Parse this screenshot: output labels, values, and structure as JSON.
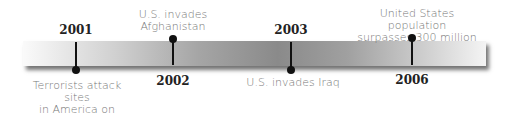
{
  "timeline": {
    "events": [
      {
        "year": "2001",
        "label_lines": [
          "Terrorists attack sites",
          "in America on",
          "September 11"
        ],
        "position": "below"
      },
      {
        "year": "2002",
        "label_lines": [
          "U.S. invades",
          "Afghanistan"
        ],
        "position": "above"
      },
      {
        "year": "2003",
        "label_lines": [
          "U.S. invades Iraq"
        ],
        "position": "below"
      },
      {
        "year": "2006",
        "label_lines": [
          "United States population",
          "surpasses 300 million"
        ],
        "position": "above"
      }
    ]
  }
}
